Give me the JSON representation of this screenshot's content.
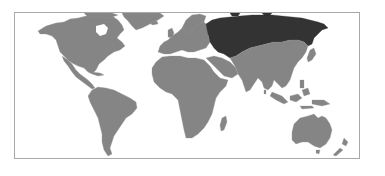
{
  "map": {
    "type": "world-choropleth",
    "projection": "equirectangular-like",
    "highlighted_region": "Russia",
    "colors": {
      "background": "#ffffff",
      "frame_border": "#a8a8a8",
      "land": "#858585",
      "highlight": "#333333"
    },
    "regions": [
      {
        "name": "North America",
        "highlighted": false
      },
      {
        "name": "Greenland",
        "highlighted": false
      },
      {
        "name": "Central America",
        "highlighted": false
      },
      {
        "name": "South America",
        "highlighted": false
      },
      {
        "name": "Europe",
        "highlighted": false
      },
      {
        "name": "Africa",
        "highlighted": false
      },
      {
        "name": "Madagascar",
        "highlighted": false
      },
      {
        "name": "Russia",
        "highlighted": true
      },
      {
        "name": "Asia",
        "highlighted": false
      },
      {
        "name": "Southeast Asia",
        "highlighted": false
      },
      {
        "name": "Australia",
        "highlighted": false
      },
      {
        "name": "New Zealand",
        "highlighted": false
      }
    ]
  }
}
